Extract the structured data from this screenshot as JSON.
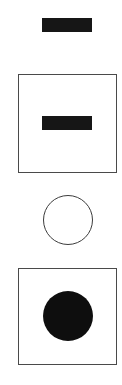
{
  "symbols": [
    {
      "id": "bar-standalone",
      "shape": "horizontal-bar",
      "fill": "#161616",
      "framed": false
    },
    {
      "id": "bar-in-box",
      "shape": "horizontal-bar",
      "fill": "#161616",
      "framed": true,
      "frame_color": "#4a4a4a"
    },
    {
      "id": "circle-standalone",
      "shape": "circle-outline",
      "stroke": "#3c3c3c",
      "framed": false
    },
    {
      "id": "circle-in-box",
      "shape": "circle-filled",
      "fill": "#0e0e0e",
      "framed": true,
      "frame_color": "#4a4a4a"
    }
  ]
}
